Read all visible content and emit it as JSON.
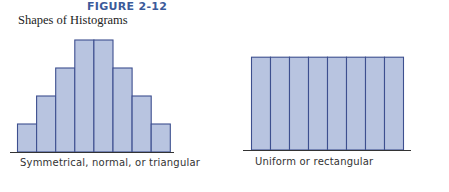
{
  "figure": {
    "label": "FIGURE 2-12",
    "title": "Shapes of Histograms"
  },
  "colors": {
    "label": "#3b5a9a",
    "bar_fill": "#b8c4e0",
    "bar_stroke": "#3d4f8f",
    "axis": "#333333"
  },
  "chart_data": [
    {
      "type": "bar",
      "title": "Symmetrical, normal, or triangular",
      "categories": [
        "1",
        "2",
        "3",
        "4",
        "5",
        "6",
        "7",
        "8"
      ],
      "values": [
        1,
        2,
        3,
        4,
        4,
        3,
        2,
        1
      ],
      "xlabel": "Symmetrical, normal, or triangular",
      "ylabel": "",
      "grid": false,
      "legend": false
    },
    {
      "type": "bar",
      "title": "Uniform or rectangular",
      "categories": [
        "1",
        "2",
        "3",
        "4",
        "5",
        "6",
        "7",
        "8"
      ],
      "values": [
        4,
        4,
        4,
        4,
        4,
        4,
        4,
        4
      ],
      "xlabel": "Uniform or rectangular",
      "ylabel": "",
      "grid": false,
      "legend": false
    }
  ]
}
